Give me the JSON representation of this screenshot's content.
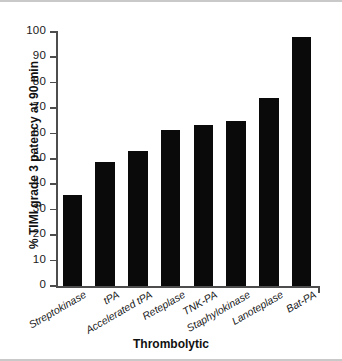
{
  "figure": {
    "background_color": "#ffffff",
    "bar_color": "#0a0a0a",
    "axis_color": "#4d4d4d",
    "frame_color": "#c9c9c9"
  },
  "chart_data": {
    "type": "bar",
    "title": "",
    "xlabel": "Thrombolytic",
    "ylabel": "% TIMI grade 3 patency at 90 min",
    "categories": [
      "Streptokinase",
      "tPA",
      "Accelerated tPA",
      "Reteplase",
      "TNK-PA",
      "Staphylokinase",
      "Lanoteplase",
      "Bat-PA"
    ],
    "values": [
      36,
      49,
      53,
      61.5,
      63.5,
      65,
      74,
      98
    ],
    "ylim": [
      0,
      100
    ],
    "yticks": [
      0,
      10,
      20,
      30,
      40,
      50,
      60,
      70,
      80,
      90,
      100
    ],
    "ytick_labels": [
      "0",
      "10",
      "20",
      "30",
      "40",
      "50",
      "60",
      "70",
      "80",
      "90",
      "100"
    ],
    "grid": false,
    "legend": null,
    "orientation": "vertical",
    "xtick_label_rotation": -30
  }
}
